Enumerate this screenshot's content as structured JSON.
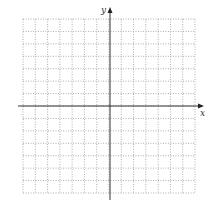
{
  "diagram": {
    "type": "coordinate-plane",
    "x_label": "x",
    "y_label": "y",
    "grid": {
      "columns": 14,
      "rows": 14,
      "left": 23,
      "top": 19,
      "right": 195,
      "bottom": 193,
      "line_color": "#9a9a9a",
      "line_style": "dotted"
    },
    "axes": {
      "origin_x": 110,
      "origin_y": 106,
      "x_start": 18,
      "x_end": 204,
      "y_start": 200,
      "y_end": 7,
      "color": "#333333"
    }
  }
}
